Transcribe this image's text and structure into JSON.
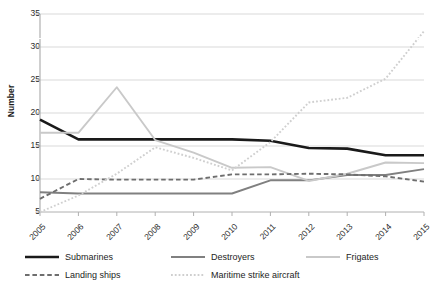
{
  "chart_data": {
    "type": "line",
    "title": "",
    "xlabel": "",
    "ylabel": "Number",
    "x": [
      "2005",
      "2006",
      "2007",
      "2008",
      "2009",
      "2010",
      "2011",
      "2012",
      "2013",
      "2014",
      "2015"
    ],
    "ylim": [
      5,
      35
    ],
    "yticks": [
      5,
      10,
      15,
      20,
      25,
      30,
      35
    ],
    "grid": "horizontal",
    "legend_position": "bottom",
    "series": [
      {
        "name": "Submarines",
        "color": "#1a1a1a",
        "style": "solid",
        "width": 2.6,
        "values": [
          19,
          16,
          16,
          16,
          16,
          16,
          15.8,
          14.7,
          14.6,
          13.6,
          13.6
        ]
      },
      {
        "name": "Destroyers",
        "color": "#808080",
        "style": "solid",
        "width": 1.9,
        "values": [
          8,
          7.8,
          7.8,
          7.8,
          7.8,
          7.8,
          9.8,
          9.8,
          10.6,
          10.6,
          11.5
        ]
      },
      {
        "name": "Frigates",
        "color": "#c9c9c9",
        "style": "solid",
        "width": 1.9,
        "values": [
          17,
          17,
          23.9,
          15.9,
          14,
          11.7,
          11.8,
          9.7,
          10.8,
          12.5,
          12.4
        ]
      },
      {
        "name": "Landing ships",
        "color": "#6e6e6e",
        "style": "dashed",
        "width": 1.9,
        "values": [
          7,
          10,
          9.9,
          9.9,
          9.9,
          10.7,
          10.7,
          10.8,
          10.7,
          10.4,
          9.6
        ]
      },
      {
        "name": "Maritime strike aircraft",
        "color": "#cfcfcf",
        "style": "dotted",
        "width": 1.9,
        "values": [
          5,
          7.5,
          10.8,
          14.8,
          13.2,
          11.3,
          15.6,
          21.6,
          22.3,
          25.2,
          32.4
        ]
      }
    ]
  },
  "legend": {
    "items": [
      {
        "label": "Submarines"
      },
      {
        "label": "Destroyers"
      },
      {
        "label": "Frigates"
      },
      {
        "label": "Landing ships"
      },
      {
        "label": "Maritime strike aircraft"
      }
    ]
  },
  "axes": {
    "y_title": "Number",
    "y_tick_labels": [
      "35",
      "30",
      "25",
      "20",
      "15",
      "10",
      "5"
    ],
    "x_tick_labels": [
      "2005",
      "2006",
      "2007",
      "2008",
      "2009",
      "2010",
      "2011",
      "2012",
      "2013",
      "2014",
      "2015"
    ]
  },
  "colors": {
    "grid": "#d9d9d9",
    "axis": "#b0b0b0",
    "text": "#222222"
  }
}
